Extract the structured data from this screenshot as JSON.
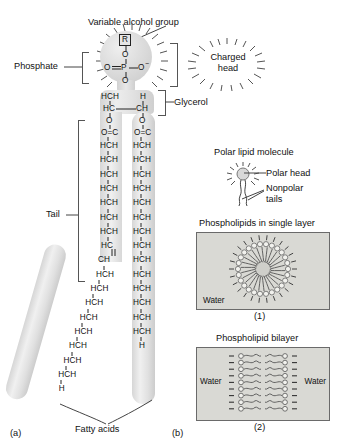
{
  "figure": {
    "panel_a_tag": "(a)",
    "panel_b_tag": "(b)"
  },
  "structure": {
    "callout_variable_alcohol": "Variable alcohol group",
    "label_phosphate": "Phosphate",
    "label_charged_head": "Charged\nhead",
    "label_charged_head_line1": "Charged",
    "label_charged_head_line2": "head",
    "label_glycerol": "Glycerol",
    "label_tail": "Tail",
    "label_fatty_acids": "Fatty acids",
    "r_group": "R",
    "phosphate_top_o": "O",
    "phosphate_core": "O=P—O",
    "phosphate_core_left": "O",
    "phosphate_core_mid": "P",
    "phosphate_core_right": "O",
    "phosphate_charge": "−",
    "phosphate_bottom_o": "O",
    "glycerol_c1": "HCH",
    "glycerol_c3_h": "H",
    "glycerol_c2_left": "HC",
    "glycerol_c2_right": "CH",
    "ester_o_left": "O",
    "ester_o_right": "O",
    "carbonyl_left": "O=C",
    "carbonyl_right": "O=C",
    "methylene": "HCH",
    "terminal_h": "H",
    "unsat_left": "HC",
    "unsat_right": "CH",
    "left_tail_units_before_kink": 7,
    "left_tail_units_after_kink": 8,
    "right_tail_units": 14
  },
  "legend": {
    "title": "Polar lipid molecule",
    "polar_head": "Polar head",
    "nonpolar_tails_line1": "Nonpolar",
    "nonpolar_tails_line2": "tails"
  },
  "panel1": {
    "title": "Phospholipids in single layer",
    "water": "Water",
    "number": "(1)"
  },
  "panel2": {
    "title": "Phospholipid bilayer",
    "water_left": "Water",
    "water_right": "Water",
    "number": "(2)"
  },
  "colors": {
    "ink": "#111111",
    "line": "#444444",
    "panel_bg": "#d9d9d4",
    "panel_border": "#6a6a6a",
    "molecule_gray": "#dcdcdc"
  }
}
